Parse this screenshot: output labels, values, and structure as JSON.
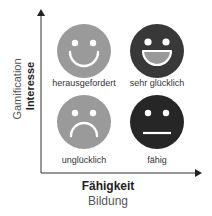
{
  "axes": {
    "x_primary": "Fähigkeit",
    "x_secondary": "Bildung",
    "y_primary": "Interesse",
    "y_secondary": "Gamification"
  },
  "quadrants": [
    {
      "position": "top-left",
      "label": "herausgefordert",
      "expression": "smile",
      "color": "#9a9a9a"
    },
    {
      "position": "top-right",
      "label": "sehr glücklich",
      "expression": "big-grin",
      "color": "#3a3a3a"
    },
    {
      "position": "bottom-left",
      "label": "unglücklich",
      "expression": "frown",
      "color": "#9a9a9a"
    },
    {
      "position": "bottom-right",
      "label": "fähig",
      "expression": "neutral",
      "color": "#262626"
    }
  ],
  "colors": {
    "axis": "#333333",
    "light_face": "#9a9a9a",
    "dark_face": "#333333",
    "feature": "#ffffff",
    "mouth_fill": "#9a9a9a"
  }
}
